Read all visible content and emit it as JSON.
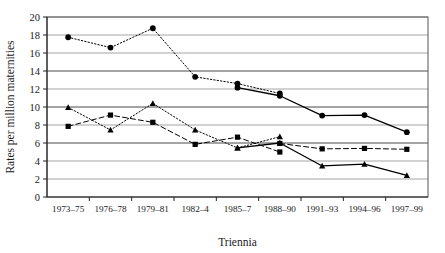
{
  "chart_data": {
    "type": "line",
    "title": "",
    "xlabel": "Triennia",
    "ylabel": "Rates  per million maternities",
    "categories": [
      "1973–75",
      "1976–78",
      "1979–81",
      "1982–4",
      "1985–7",
      "1988–90",
      "1991–93",
      "1994–96",
      "1997–99"
    ],
    "ylim": [
      0,
      20
    ],
    "ytick_step": 2,
    "yticks": [
      "20",
      "18",
      "16",
      "14",
      "12",
      "10",
      "8",
      "6",
      "4",
      "2",
      "0"
    ],
    "grid": true,
    "grid_axis": "y",
    "legend": "none",
    "series": [
      {
        "name": "series-circle-dotted",
        "marker": "circle",
        "line_style": "dotted",
        "color": "#000000",
        "values": [
          17.75,
          16.6,
          18.75,
          13.35,
          12.6,
          11.5,
          null,
          null,
          null
        ]
      },
      {
        "name": "series-circle-solid",
        "marker": "circle",
        "line_style": "solid",
        "color": "#000000",
        "values": [
          null,
          null,
          null,
          null,
          12.15,
          11.25,
          9.05,
          9.1,
          7.2
        ]
      },
      {
        "name": "series-triangle-dotted",
        "marker": "triangle",
        "line_style": "dotted",
        "color": "#000000",
        "values": [
          9.95,
          7.45,
          10.4,
          7.45,
          5.45,
          6.7,
          null,
          null,
          null
        ]
      },
      {
        "name": "series-triangle-solid",
        "marker": "triangle",
        "line_style": "solid",
        "color": "#000000",
        "values": [
          null,
          null,
          null,
          null,
          5.45,
          6.0,
          3.45,
          3.65,
          2.4
        ]
      },
      {
        "name": "series-square-dashed-early",
        "marker": "square",
        "line_style": "dashed",
        "color": "#000000",
        "values": [
          7.85,
          9.1,
          8.3,
          5.85,
          6.65,
          5.0,
          null,
          null,
          null
        ]
      },
      {
        "name": "series-square-dashed-late",
        "marker": "square",
        "line_style": "dashed",
        "color": "#000000",
        "values": [
          null,
          null,
          null,
          null,
          null,
          5.95,
          5.35,
          5.4,
          5.3
        ]
      }
    ]
  }
}
